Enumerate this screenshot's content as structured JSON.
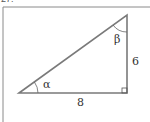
{
  "problem": {
    "number": "27."
  },
  "figure": {
    "type": "right-triangle",
    "angles": {
      "alpha": "α",
      "beta": "β"
    },
    "sides": {
      "vertical_leg": "6",
      "horizontal_leg": "8"
    },
    "colors": {
      "stroke": "#7a7a7a",
      "frame": "#8a8a8a",
      "text": "#333333"
    }
  }
}
